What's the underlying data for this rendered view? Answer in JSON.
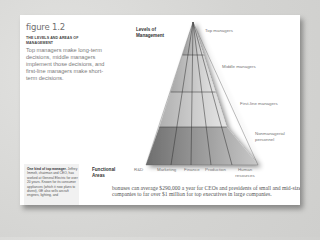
{
  "figure": {
    "number": "figure 1.2",
    "subtitle": "THE LEVELS AND AREAS OF MANAGEMENT",
    "caption": "Top managers make long-term decisions, middle managers implement those decisions, and first-line managers make short-term decisions."
  },
  "diagram": {
    "levels_heading": "Levels of Management",
    "levels": [
      {
        "label": "Top managers"
      },
      {
        "label": "Middle managers"
      },
      {
        "label": "First-line managers"
      },
      {
        "label": "Nonmanagerial personnel"
      }
    ],
    "areas_heading": "Functional Areas",
    "areas": [
      "R&D",
      "Marketing",
      "Finance",
      "Production",
      "Human resources"
    ]
  },
  "sidebar": {
    "heading": "One kind of top manager.",
    "text": "Jeffrey Immelt, chairman and CEO, has worked at General Electric for over 20 years. Known for its consumer appliances (which it now plans to divest), GE also sells aircraft engines, lighting, and"
  },
  "body": {
    "text": "bonuses can average $290,000 a year for CEOs and presidents of small and mid-size companies to far over $1 million for top executives in large companies."
  }
}
